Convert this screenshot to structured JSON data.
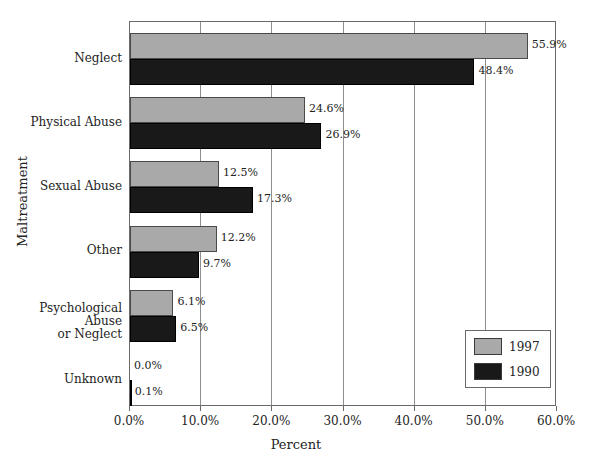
{
  "chart_data": {
    "type": "bar",
    "orientation": "horizontal",
    "title": "",
    "xlabel": "Percent",
    "ylabel": "Maltreatment",
    "xlim": [
      0,
      60
    ],
    "grid": true,
    "legend_position": "bottom-right",
    "categories": [
      "Neglect",
      "Physical Abuse",
      "Sexual Abuse",
      "Other",
      "Psychological Abuse\nor Neglect",
      "Unknown"
    ],
    "xticks": [
      "0.0%",
      "10.0%",
      "20.0%",
      "30.0%",
      "40.0%",
      "50.0%",
      "60.0%"
    ],
    "xtick_values": [
      0,
      10,
      20,
      30,
      40,
      50,
      60
    ],
    "series": [
      {
        "name": "1997",
        "color": "#a9a9a9",
        "values": [
          55.9,
          24.6,
          12.5,
          12.2,
          6.1,
          0.0
        ],
        "labels": [
          "55.9%",
          "24.6%",
          "12.5%",
          "12.2%",
          "6.1%",
          "0.0%"
        ]
      },
      {
        "name": "1990",
        "color": "#191919",
        "values": [
          48.4,
          26.9,
          17.3,
          9.7,
          6.5,
          0.1
        ],
        "labels": [
          "48.4%",
          "26.9%",
          "17.3%",
          "9.7%",
          "6.5%",
          "0.1%"
        ]
      }
    ]
  },
  "legend": {
    "entries": [
      {
        "label": "1997",
        "color": "#a9a9a9"
      },
      {
        "label": "1990",
        "color": "#191919"
      }
    ]
  },
  "top_crop_text": ""
}
